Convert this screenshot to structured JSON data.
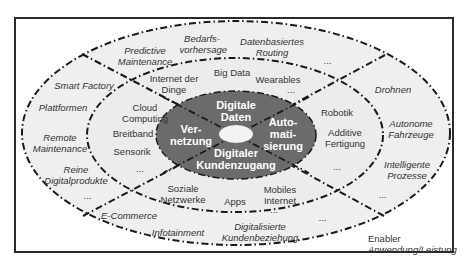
{
  "colors": {
    "outer_fill": "#efefef",
    "middle_fill": "#eaeaea",
    "core_fill": "#6b6b6b",
    "hole_fill": "#f2f2f2",
    "line": "#1a1a1a",
    "frame": "#2a2a2a",
    "text": "#333333"
  },
  "core": {
    "top": "Digitale Daten",
    "left": "Ver-\nnetzung",
    "right": "Auto-\nmati-\nsierung",
    "bottom": "Digitaler Kundenzugang"
  },
  "enabler_ring": {
    "vernetzung": [
      "Cloud Computing",
      "Breitband",
      "Sensorik",
      "..."
    ],
    "digitale_daten": [
      "Internet der Dinge",
      "Big Data",
      "Wearables",
      "..."
    ],
    "automatisierung": [
      "Robotik",
      "Additive Fertigung",
      "..."
    ],
    "kundenzugang": [
      "Soziale Netzwerke",
      "Apps",
      "Mobiles Internet",
      "..."
    ]
  },
  "application_ring": {
    "vernetzung": [
      "Smart Factory",
      "Plattformen",
      "Remote Maintenance",
      "Reine Digitalprodukte",
      "..."
    ],
    "digitale_daten": [
      "Predictive Maintenance",
      "Bedarfs-vorhersage",
      "Datenbasiertes Routing",
      "..."
    ],
    "automatisierung": [
      "Drohnen",
      "Autonome Fahrzeuge",
      "Intelligente Prozesse",
      "..."
    ],
    "kundenzugang": [
      "E-Commerce",
      "Infotainment",
      "Digitalisierte Kundenbeziehung",
      "..."
    ]
  },
  "legend": {
    "enabler": "Enabler",
    "application": "Anwendung/Leistung"
  }
}
